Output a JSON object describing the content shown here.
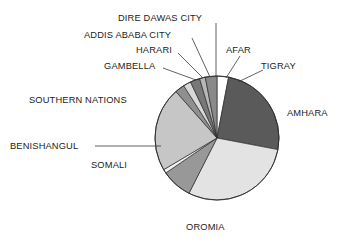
{
  "chart_data": {
    "type": "pie",
    "title": "",
    "subtitle": "",
    "xlabel": "",
    "ylabel": "",
    "legend_position": "none",
    "grid": false,
    "labels_outside": true,
    "categories": [
      "TIGRAY",
      "AMHARA",
      "OROMIA",
      "SOMALI",
      "BENISHANGUL",
      "SOUTHERN NATIONS",
      "GAMBELLA",
      "HARARI",
      "ADDIS ABABA CITY",
      "DIRE DAWAS CITY",
      "AFAR"
    ],
    "values": [
      3.0,
      25.0,
      29.5,
      8.0,
      1.0,
      22.0,
      2.5,
      2.0,
      2.5,
      1.5,
      3.0
    ],
    "slices": [
      {
        "label": "TIGRAY",
        "value": 3.0,
        "start_deg": 0.0,
        "end_deg": 10.8,
        "color": "#ffffff"
      },
      {
        "label": "AMHARA",
        "value": 25.0,
        "start_deg": 10.8,
        "end_deg": 100.8,
        "color": "#5a5a5a"
      },
      {
        "label": "OROMIA",
        "value": 29.5,
        "start_deg": 100.8,
        "end_deg": 206.9,
        "color": "#e3e3e3"
      },
      {
        "label": "SOMALI",
        "value": 8.0,
        "start_deg": 206.9,
        "end_deg": 235.7,
        "color": "#989898"
      },
      {
        "label": "BENISHANGUL",
        "value": 1.0,
        "start_deg": 235.7,
        "end_deg": 239.3,
        "color": "#f2f2f2"
      },
      {
        "label": "SOUTHERN NATIONS",
        "value": 22.0,
        "start_deg": 239.3,
        "end_deg": 318.5,
        "color": "#c6c6c6"
      },
      {
        "label": "GAMBELLA",
        "value": 2.5,
        "start_deg": 318.5,
        "end_deg": 327.5,
        "color": "#8f8f8f"
      },
      {
        "label": "HARARI",
        "value": 2.0,
        "start_deg": 327.5,
        "end_deg": 334.7,
        "color": "#d8d8d8"
      },
      {
        "label": "ADDIS ABABA CITY",
        "value": 2.5,
        "start_deg": 334.7,
        "end_deg": 343.7,
        "color": "#787878"
      },
      {
        "label": "DIRE DAWAS CITY",
        "value": 1.5,
        "start_deg": 343.7,
        "end_deg": 349.1,
        "color": "#b8b8b8"
      },
      {
        "label": "AFAR",
        "value": 3.0,
        "start_deg": 349.1,
        "end_deg": 360.0,
        "color": "#8a8a8a"
      }
    ],
    "colors": {
      "outline": "#2b2b2b",
      "leader": "#3a3a3a",
      "text": "#222222",
      "background": "#ffffff"
    }
  },
  "labels": {
    "dire_dawas_city": "DIRE DAWAS CITY",
    "addis_ababa_city": "ADDIS ABABA CITY",
    "harari": "HARARI",
    "gambella": "GAMBELLA",
    "southern_nations": "SOUTHERN NATIONS",
    "benishangul": "BENISHANGUL",
    "somali": "SOMALI",
    "oromia": "OROMIA",
    "amhara": "AMHARA",
    "tigray": "TIGRAY",
    "afar": "AFAR"
  }
}
